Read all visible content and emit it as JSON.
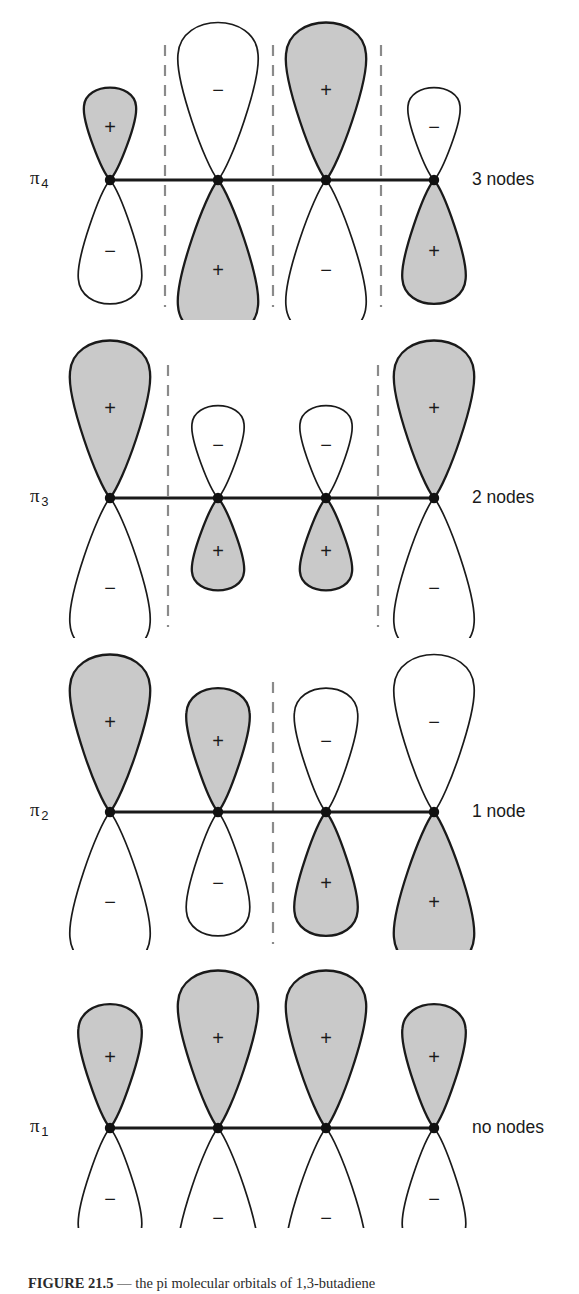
{
  "figure": {
    "title": "Pi molecular orbitals of 1,3-butadiene",
    "caption_number": "FIGURE 21.5",
    "caption_text": "  — the pi molecular orbitals of 1,3-butadiene",
    "background_color": "#ffffff",
    "lobe_fill_shaded": "#c9c9c9",
    "lobe_fill_unshaded": "#ffffff",
    "lobe_stroke": "#1a1a1a",
    "atom_dot_color": "#111111",
    "backbone_color": "#1a1a1a",
    "node_line_color": "#8a8a8a"
  },
  "orbitals": [
    {
      "id": "pi4",
      "symbol": "π",
      "subscript": "4",
      "node_label": "3 nodes",
      "node_count": 3,
      "row_top": 20,
      "axis_y": 180,
      "atoms_x": [
        110,
        218,
        326,
        434
      ],
      "node_lines_x": [
        165,
        273,
        381
      ],
      "node_line_top": 45,
      "node_line_height": 262,
      "lobes": [
        {
          "atom": 1,
          "top_sign": "+",
          "top_shaded": true,
          "top_size": "small",
          "bottom_sign": "−",
          "bottom_shaded": false,
          "bottom_size": "medium"
        },
        {
          "atom": 2,
          "top_sign": "−",
          "top_shaded": false,
          "top_size": "large",
          "bottom_sign": "+",
          "bottom_shaded": true,
          "bottom_size": "large"
        },
        {
          "atom": 3,
          "top_sign": "+",
          "top_shaded": true,
          "top_size": "large",
          "bottom_sign": "−",
          "bottom_shaded": false,
          "bottom_size": "large"
        },
        {
          "atom": 4,
          "top_sign": "−",
          "top_shaded": false,
          "top_size": "small",
          "bottom_sign": "+",
          "bottom_shaded": true,
          "bottom_size": "medium"
        }
      ]
    },
    {
      "id": "pi3",
      "symbol": "π",
      "subscript": "3",
      "node_label": "2 nodes",
      "node_count": 2,
      "row_top": 338,
      "axis_y": 498,
      "atoms_x": [
        110,
        218,
        326,
        434
      ],
      "node_lines_x": [
        168,
        378
      ],
      "node_line_top": 365,
      "node_line_height": 262,
      "lobes": [
        {
          "atom": 1,
          "top_sign": "+",
          "top_shaded": true,
          "top_size": "large",
          "bottom_sign": "−",
          "bottom_shaded": false,
          "bottom_size": "large"
        },
        {
          "atom": 2,
          "top_sign": "−",
          "top_shaded": false,
          "top_size": "small",
          "bottom_sign": "+",
          "bottom_shaded": true,
          "bottom_size": "small"
        },
        {
          "atom": 3,
          "top_sign": "−",
          "top_shaded": false,
          "top_size": "small",
          "bottom_sign": "+",
          "bottom_shaded": true,
          "bottom_size": "small"
        },
        {
          "atom": 4,
          "top_sign": "+",
          "top_shaded": true,
          "top_size": "large",
          "bottom_sign": "−",
          "bottom_shaded": false,
          "bottom_size": "large"
        }
      ]
    },
    {
      "id": "pi2",
      "symbol": "π",
      "subscript": "2",
      "node_label": "1 node",
      "node_count": 1,
      "row_top": 650,
      "axis_y": 812,
      "atoms_x": [
        110,
        218,
        326,
        434
      ],
      "node_lines_x": [
        273
      ],
      "node_line_top": 682,
      "node_line_height": 262,
      "lobes": [
        {
          "atom": 1,
          "top_sign": "+",
          "top_shaded": true,
          "top_size": "large",
          "bottom_sign": "−",
          "bottom_shaded": false,
          "bottom_size": "large"
        },
        {
          "atom": 2,
          "top_sign": "+",
          "top_shaded": true,
          "top_size": "medium",
          "bottom_sign": "−",
          "bottom_shaded": false,
          "bottom_size": "medium"
        },
        {
          "atom": 3,
          "top_sign": "−",
          "top_shaded": false,
          "top_size": "medium",
          "bottom_sign": "+",
          "bottom_shaded": true,
          "bottom_size": "medium"
        },
        {
          "atom": 4,
          "top_sign": "−",
          "top_shaded": false,
          "top_size": "large",
          "bottom_sign": "+",
          "bottom_shaded": true,
          "bottom_size": "large"
        }
      ]
    },
    {
      "id": "pi1",
      "symbol": "π",
      "subscript": "1",
      "node_label": "no nodes",
      "node_count": 0,
      "row_top": 968,
      "axis_y": 1128,
      "atoms_x": [
        110,
        218,
        326,
        434
      ],
      "node_lines_x": [],
      "node_line_top": 0,
      "node_line_height": 0,
      "lobes": [
        {
          "atom": 1,
          "top_sign": "+",
          "top_shaded": true,
          "top_size": "medium",
          "bottom_sign": "−",
          "bottom_shaded": false,
          "bottom_size": "medium"
        },
        {
          "atom": 2,
          "top_sign": "+",
          "top_shaded": true,
          "top_size": "large",
          "bottom_sign": "−",
          "bottom_shaded": false,
          "bottom_size": "large"
        },
        {
          "atom": 3,
          "top_sign": "+",
          "top_shaded": true,
          "top_size": "large",
          "bottom_sign": "−",
          "bottom_shaded": false,
          "bottom_size": "large"
        },
        {
          "atom": 4,
          "top_sign": "+",
          "top_shaded": true,
          "top_size": "medium",
          "bottom_sign": "−",
          "bottom_shaded": false,
          "bottom_size": "medium"
        }
      ]
    }
  ],
  "label_positions": {
    "symbol_x": 30,
    "node_label_x": 472
  }
}
